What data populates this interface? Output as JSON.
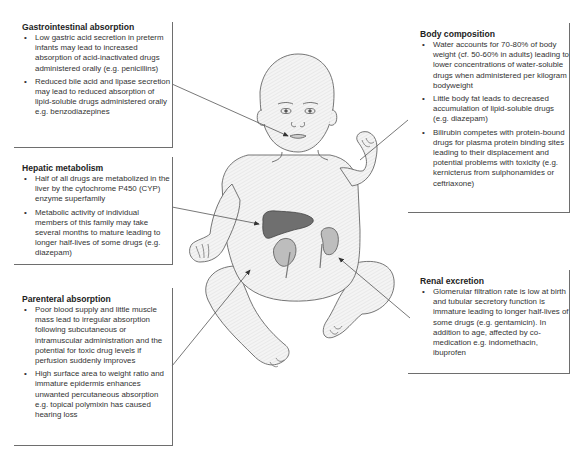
{
  "diagram": {
    "organs": [
      "liver",
      "left-kidney",
      "right-kidney"
    ],
    "colors": {
      "box_border": "#6e6e6e",
      "pointer_line": "#555555",
      "skin_fill": "#f2f2f2",
      "outline": "#555555",
      "liver": "#6f6f6f",
      "kidney": "#bdbdbd"
    }
  },
  "boxes": {
    "gastrointestinal": {
      "title": "Gastrointestinal absorption",
      "bullets": [
        "Low gastric acid secretion in preterm infants may lead to increased absorption of acid-inactivated drugs administered orally (e.g. penicillins)",
        "Reduced bile acid and lipase secretion may lead to reduced absorption of lipid-soluble drugs administered orally e.g. benzodiazepines"
      ]
    },
    "hepatic": {
      "title": "Hepatic metabolism",
      "bullets": [
        "Half of all drugs are metabolized in the liver by the cytochrome P450 (CYP) enzyme superfamily",
        "Metabolic activity of individual members of this family may take several months to mature leading to longer half-lives of some drugs (e.g. diazepam)"
      ]
    },
    "parenteral": {
      "title": "Parenteral absorption",
      "bullets": [
        "Poor blood supply and little muscle mass lead to irregular absorption following subcutaneous or intramuscular administration and the potential for toxic drug levels if perfusion suddenly improves",
        "High surface area to weight ratio and immature epidermis enhances unwanted percutaneous absorption e.g. topical polymixin has caused hearing loss"
      ]
    },
    "body_composition": {
      "title": "Body composition",
      "bullets": [
        "Water accounts for 70-80% of body weight (cf. 50-60% in adults) leading to lower concentrations of water-soluble drugs when administered per kilogram bodyweight",
        "Little body fat leads to decreased accumulation of lipid-soluble drugs (e.g. diazepam)",
        "Bilirubin competes with protein-bound drugs for plasma protein binding sites leading to their displacement and potential problems with toxicity (e.g. kernicterus from sulphonamides or ceftriaxone)"
      ]
    },
    "renal": {
      "title": "Renal excretion",
      "bullets": [
        "Glomerular filtration rate is low at birth and tubular secretory function is immature leading to longer half-lives of some drugs (e.g. gentamicin). In addition to age, affected by co-medication e.g. indomethacin, ibuprofen"
      ]
    }
  }
}
